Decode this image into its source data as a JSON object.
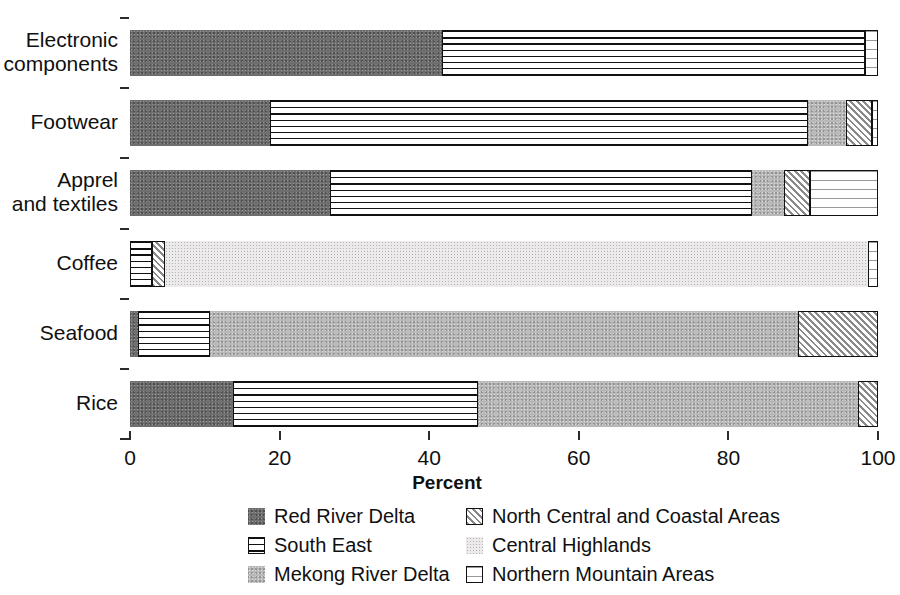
{
  "chart_data": {
    "type": "bar",
    "orientation": "horizontal",
    "stacked": true,
    "title": "",
    "xlabel": "Percent",
    "ylabel": "",
    "xlim": [
      0,
      100
    ],
    "xticks": [
      0,
      20,
      40,
      60,
      80,
      100
    ],
    "grid": false,
    "legend_position": "bottom",
    "categories": [
      "Electronic components",
      "Footwear",
      "Apprel and textiles",
      "Coffee",
      "Seafood",
      "Rice"
    ],
    "series": [
      {
        "name": "Red River Delta",
        "key": "rrd",
        "values": [
          41.7,
          18.7,
          26.7,
          0.0,
          1.1,
          13.8
        ]
      },
      {
        "name": "South East",
        "key": "se",
        "values": [
          56.5,
          71.9,
          56.5,
          2.9,
          9.6,
          32.7
        ]
      },
      {
        "name": "Mekong River Delta",
        "key": "mrd",
        "values": [
          0.0,
          5.1,
          4.2,
          0.0,
          78.6,
          50.8
        ]
      },
      {
        "name": "North Central and Coastal Areas",
        "key": "ncca",
        "values": [
          0.0,
          3.5,
          3.5,
          1.8,
          10.7,
          2.7
        ]
      },
      {
        "name": "Central Highlands",
        "key": "ch",
        "values": [
          0.0,
          0.0,
          0.0,
          94.0,
          0.0,
          0.0
        ]
      },
      {
        "name": "Northern Mountain Areas",
        "key": "nma",
        "values": [
          1.8,
          0.8,
          9.1,
          1.3,
          0.0,
          0.0
        ]
      }
    ],
    "stacks": [
      {
        "category": "Electronic components",
        "segments": [
          {
            "key": "rrd",
            "start": 0,
            "end": 41.7
          },
          {
            "key": "se",
            "start": 41.7,
            "end": 98.2
          },
          {
            "key": "nma",
            "start": 98.2,
            "end": 100
          }
        ]
      },
      {
        "category": "Footwear",
        "segments": [
          {
            "key": "rrd",
            "start": 0,
            "end": 18.7
          },
          {
            "key": "se",
            "start": 18.7,
            "end": 90.6
          },
          {
            "key": "mrd",
            "start": 90.6,
            "end": 95.7
          },
          {
            "key": "ncca",
            "start": 95.7,
            "end": 99.2
          },
          {
            "key": "nma",
            "start": 99.2,
            "end": 100
          }
        ]
      },
      {
        "category": "Apprel and textiles",
        "segments": [
          {
            "key": "rrd",
            "start": 0,
            "end": 26.7
          },
          {
            "key": "se",
            "start": 26.7,
            "end": 83.2
          },
          {
            "key": "mrd",
            "start": 83.2,
            "end": 87.4
          },
          {
            "key": "ncca",
            "start": 87.4,
            "end": 90.9
          },
          {
            "key": "nma",
            "start": 90.9,
            "end": 100
          }
        ]
      },
      {
        "category": "Coffee",
        "segments": [
          {
            "key": "se",
            "start": 0,
            "end": 2.9
          },
          {
            "key": "ncca",
            "start": 2.9,
            "end": 4.7
          },
          {
            "key": "ch",
            "start": 4.7,
            "end": 98.7
          },
          {
            "key": "nma",
            "start": 98.7,
            "end": 100
          }
        ]
      },
      {
        "category": "Seafood",
        "segments": [
          {
            "key": "rrd",
            "start": 0,
            "end": 1.1
          },
          {
            "key": "se",
            "start": 1.1,
            "end": 10.7
          },
          {
            "key": "mrd",
            "start": 10.7,
            "end": 89.3
          },
          {
            "key": "ncca",
            "start": 89.3,
            "end": 100
          }
        ]
      },
      {
        "category": "Rice",
        "segments": [
          {
            "key": "rrd",
            "start": 0,
            "end": 13.8
          },
          {
            "key": "se",
            "start": 13.8,
            "end": 46.5
          },
          {
            "key": "mrd",
            "start": 46.5,
            "end": 97.3
          },
          {
            "key": "ncca",
            "start": 97.3,
            "end": 100
          }
        ]
      }
    ]
  },
  "axis": {
    "x_title": "Percent",
    "x_tick_labels": [
      "0",
      "20",
      "40",
      "60",
      "80",
      "100"
    ],
    "y_tick_labels": [
      [
        "Electronic",
        "components"
      ],
      [
        "Footwear"
      ],
      [
        "Apprel",
        "and textiles"
      ],
      [
        "Coffee"
      ],
      [
        "Seafood"
      ],
      [
        "Rice"
      ]
    ]
  },
  "legend": {
    "column1": [
      {
        "label": "Red River Delta",
        "key": "rrd"
      },
      {
        "label": "South East",
        "key": "se"
      },
      {
        "label": "Mekong River Delta",
        "key": "mrd"
      }
    ],
    "column2": [
      {
        "label": "North Central and Coastal Areas",
        "key": "ncca"
      },
      {
        "label": "Central Highlands",
        "key": "ch"
      },
      {
        "label": "Northern Mountain Areas",
        "key": "nma"
      }
    ]
  },
  "colors": {
    "red_river_delta": "#6e6e6e",
    "mekong_river_delta": "#b9b9b9",
    "central_highlands": "#eceaea",
    "outline": "#111111",
    "axis": "#2b2b2b",
    "text": "#101010"
  }
}
